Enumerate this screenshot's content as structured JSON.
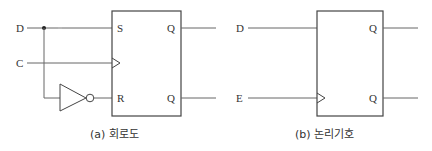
{
  "diagram": {
    "left": {
      "caption": "(a) 회로도",
      "inputs": {
        "d": "D",
        "c": "C"
      },
      "pins": {
        "s": "S",
        "r": "R",
        "q": "Q",
        "q_bar": "Q"
      }
    },
    "right": {
      "caption": "(b) 논리기호",
      "inputs": {
        "d": "D",
        "e": "E"
      },
      "pins": {
        "q": "Q",
        "q_bar": "Q"
      }
    },
    "colors": {
      "wire": "#666666",
      "box": "#444444",
      "text": "#333333"
    }
  }
}
